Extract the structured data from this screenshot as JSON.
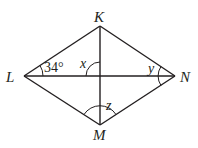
{
  "figure": {
    "type": "rhombus with diagonals",
    "vertices": {
      "K": {
        "label": "K",
        "x": 100,
        "y": 26
      },
      "L": {
        "label": "L",
        "x": 24,
        "y": 76
      },
      "N": {
        "label": "N",
        "x": 175,
        "y": 76
      },
      "M": {
        "label": "M",
        "x": 100,
        "y": 125
      }
    },
    "angles": {
      "angle_KLN": {
        "label": "34°",
        "vertex": "L"
      },
      "angle_x": {
        "label": "x",
        "vertex": "center"
      },
      "angle_y": {
        "label": "y",
        "vertex": "N"
      },
      "angle_z": {
        "label": "z",
        "vertex": "M"
      }
    },
    "colors": {
      "stroke": "#231f20",
      "background": "#ffffff"
    }
  }
}
